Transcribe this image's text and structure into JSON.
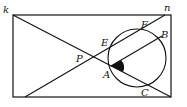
{
  "diagram": {
    "type": "geometry",
    "labels": {
      "k": "k",
      "n": "n",
      "P": "P",
      "E": "E",
      "F": "F",
      "B": "B",
      "A": "A",
      "C": "C"
    },
    "colors": {
      "stroke": "#111111",
      "background": "#ffffff"
    }
  }
}
